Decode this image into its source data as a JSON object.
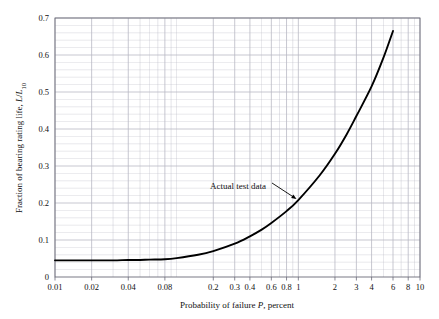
{
  "chart_data": {
    "type": "line",
    "title": "",
    "subtitle": "",
    "xlabel_parts": {
      "pre": "Probability of failure ",
      "italic": "P",
      "post": ", percent"
    },
    "xlabel": "Probability of failure P, percent",
    "ylabel_parts": {
      "pre": "Fraction of bearing rating life, ",
      "italic1": "L",
      "slash": "/",
      "italic2": "L",
      "subscript": "10"
    },
    "ylabel": "Fraction of bearing rating life, L/L10",
    "xscale": "log",
    "yscale": "linear",
    "xlim": [
      0.01,
      10
    ],
    "ylim": [
      0,
      0.7
    ],
    "grid": true,
    "grid_minor": true,
    "legend": "none",
    "line_color": "#000000",
    "grid_color": "#b9b9c4",
    "axis_color": "#6b6b78",
    "xticks": [
      {
        "value": 0.01,
        "label": "0.01",
        "major": true
      },
      {
        "value": 0.02,
        "label": "0.02",
        "major": true
      },
      {
        "value": 0.04,
        "label": "0.04",
        "major": true
      },
      {
        "value": 0.08,
        "label": "0.08",
        "major": true
      },
      {
        "value": 0.2,
        "label": "0.2",
        "major": true
      },
      {
        "value": 0.3,
        "label": "0.3",
        "major": true
      },
      {
        "value": 0.4,
        "label": "0.4",
        "major": true
      },
      {
        "value": 0.6,
        "label": "0.6",
        "major": true
      },
      {
        "value": 0.8,
        "label": "0.8",
        "major": true
      },
      {
        "value": 1,
        "label": "1",
        "major": true
      },
      {
        "value": 2,
        "label": "2",
        "major": true
      },
      {
        "value": 3,
        "label": "3",
        "major": true
      },
      {
        "value": 4,
        "label": "4",
        "major": true
      },
      {
        "value": 6,
        "label": "6",
        "major": true
      },
      {
        "value": 8,
        "label": "8",
        "major": true
      },
      {
        "value": 10,
        "label": "10",
        "major": true
      }
    ],
    "xticks_minor": [
      0.03,
      0.05,
      0.06,
      0.07,
      0.09,
      0.1,
      0.5,
      0.7,
      0.9,
      5,
      7,
      9
    ],
    "yticks": [
      {
        "value": 0,
        "label": "0"
      },
      {
        "value": 0.1,
        "label": "0.1"
      },
      {
        "value": 0.2,
        "label": "0.2"
      },
      {
        "value": 0.3,
        "label": "0.3"
      },
      {
        "value": 0.4,
        "label": "0.4"
      },
      {
        "value": 0.5,
        "label": "0.5"
      },
      {
        "value": 0.6,
        "label": "0.6"
      },
      {
        "value": 0.7,
        "label": "0.7"
      }
    ],
    "yticks_minor": [
      0.02,
      0.04,
      0.06,
      0.08,
      0.12,
      0.14,
      0.16,
      0.18,
      0.22,
      0.24,
      0.26,
      0.28,
      0.32,
      0.34,
      0.36,
      0.38,
      0.42,
      0.44,
      0.46,
      0.48,
      0.52,
      0.54,
      0.56,
      0.58,
      0.62,
      0.64,
      0.66,
      0.68
    ],
    "series": [
      {
        "name": "Actual test data",
        "points": [
          [
            0.01,
            0.045
          ],
          [
            0.02,
            0.045
          ],
          [
            0.03,
            0.045
          ],
          [
            0.04,
            0.046
          ],
          [
            0.05,
            0.046
          ],
          [
            0.06,
            0.047
          ],
          [
            0.08,
            0.048
          ],
          [
            0.1,
            0.051
          ],
          [
            0.15,
            0.06
          ],
          [
            0.2,
            0.07
          ],
          [
            0.3,
            0.09
          ],
          [
            0.4,
            0.11
          ],
          [
            0.5,
            0.128
          ],
          [
            0.6,
            0.146
          ],
          [
            0.8,
            0.178
          ],
          [
            1.0,
            0.208
          ],
          [
            1.5,
            0.275
          ],
          [
            2.0,
            0.333
          ],
          [
            2.5,
            0.386
          ],
          [
            3.0,
            0.435
          ],
          [
            4.0,
            0.515
          ],
          [
            5.0,
            0.592
          ],
          [
            6.0,
            0.665
          ]
        ]
      }
    ],
    "annotations": [
      {
        "name": "actual-test-data",
        "text": "Actual test data",
        "text_x_px": 196,
        "text_y_px": 189,
        "arrow_from_px": [
          272,
          183
        ],
        "arrow_to_px": [
          298,
          200
        ]
      }
    ]
  },
  "plot_area": {
    "left_px": 55,
    "top_px": 18,
    "right_px": 420,
    "bottom_px": 277
  }
}
